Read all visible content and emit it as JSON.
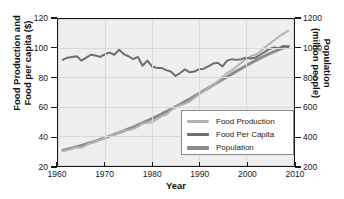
{
  "chart_data": {
    "type": "line",
    "title": "",
    "xlabel": "Year",
    "ylabel": "Food Production and\nFood per capita ($)",
    "ylabel_line1": "Food Production and",
    "ylabel_line2": "Food per capita ($)",
    "y2label_line1": "Population",
    "y2label_line2": "(million people)",
    "xlim": [
      1960,
      2010
    ],
    "ylim": [
      20,
      120
    ],
    "y2lim": [
      200,
      1200
    ],
    "xticks": [
      "1960",
      "1970",
      "1980",
      "1990",
      "2000",
      "2010"
    ],
    "xtick_values": [
      1960,
      1970,
      1980,
      1990,
      2000,
      2010
    ],
    "yticks": [
      "20",
      "40",
      "60",
      "80",
      "100",
      "120"
    ],
    "ytick_values": [
      20,
      40,
      60,
      80,
      100,
      120
    ],
    "y2ticks": [
      "200",
      "400",
      "600",
      "800",
      "1000",
      "1200"
    ],
    "y2tick_values": [
      200,
      400,
      600,
      800,
      1000,
      1200
    ],
    "grid": true,
    "legend_position": "lower right",
    "legend_entries": [
      "Food Production",
      "Food Per Capita",
      "Population"
    ],
    "colors": {
      "food_production": "#b3b3b3",
      "food_per_capita": "#6e6e6e",
      "population": "#8c8c8c",
      "plot_background": "#efefef",
      "axis": "#1a1a1a",
      "gridline": "#d9d9d9"
    },
    "x": [
      1961,
      1962,
      1963,
      1964,
      1965,
      1966,
      1967,
      1968,
      1969,
      1970,
      1971,
      1972,
      1973,
      1974,
      1975,
      1976,
      1977,
      1978,
      1979,
      1980,
      1981,
      1982,
      1983,
      1984,
      1985,
      1986,
      1987,
      1988,
      1989,
      1990,
      1991,
      1992,
      1993,
      1994,
      1995,
      1996,
      1997,
      1998,
      1999,
      2000,
      2001,
      2002,
      2003,
      2004,
      2005,
      2006,
      2007,
      2008,
      2009
    ],
    "series": [
      {
        "name": "Food Production",
        "axis": "left",
        "values": [
          29.5,
          30.3,
          31.3,
          32.2,
          32.0,
          33.6,
          35.1,
          36.3,
          37.2,
          38.6,
          40.0,
          40.5,
          42.5,
          43.3,
          44.0,
          44.6,
          46.3,
          48.5,
          49.0,
          49.3,
          51.2,
          53.3,
          54.5,
          57.3,
          59.5,
          61.0,
          62.0,
          63.5,
          66.0,
          68.5,
          70.5,
          73.0,
          75.0,
          77.0,
          80.5,
          83.0,
          85.0,
          87.5,
          90.0,
          92.5,
          94.5,
          95.5,
          97.5,
          100.5,
          103.0,
          105.5,
          108.0,
          110.0,
          112.0
        ]
      },
      {
        "name": "Food Per Capita",
        "axis": "left",
        "values": [
          92.0,
          93.5,
          94.0,
          94.5,
          91.5,
          93.5,
          95.5,
          95.0,
          94.0,
          96.0,
          97.0,
          95.5,
          99.0,
          96.0,
          94.5,
          92.5,
          94.0,
          88.0,
          91.5,
          87.5,
          86.5,
          86.5,
          85.0,
          84.0,
          81.0,
          83.0,
          85.5,
          83.5,
          84.0,
          85.5,
          86.0,
          87.5,
          89.5,
          90.0,
          87.5,
          91.5,
          92.5,
          92.0,
          92.5,
          93.5,
          93.0,
          93.5,
          95.5,
          97.5,
          99.5,
          100.5,
          100.0,
          101.5,
          101.0
        ]
      },
      {
        "name": "Population",
        "axis": "right",
        "values": [
          30.0,
          30.8,
          31.6,
          32.5,
          33.4,
          34.4,
          35.4,
          36.4,
          37.5,
          38.6,
          39.8,
          41.0,
          42.2,
          43.4,
          44.7,
          46.0,
          47.4,
          48.8,
          50.3,
          51.8,
          53.3,
          54.9,
          56.5,
          58.2,
          59.9,
          61.6,
          63.4,
          65.2,
          67.1,
          69.0,
          70.9,
          72.8,
          74.8,
          76.7,
          78.6,
          80.5,
          82.4,
          84.3,
          86.1,
          88.0,
          89.8,
          91.5,
          93.2,
          94.8,
          96.3,
          97.7,
          99.0,
          100.2,
          101.3
        ],
        "values_right_axis": [
          300,
          308,
          316,
          325,
          334,
          344,
          354,
          364,
          375,
          386,
          398,
          410,
          422,
          434,
          447,
          460,
          474,
          488,
          503,
          518,
          533,
          549,
          565,
          582,
          599,
          616,
          634,
          652,
          671,
          690,
          709,
          728,
          748,
          767,
          786,
          805,
          824,
          843,
          861,
          880,
          898,
          915,
          932,
          948,
          963,
          977,
          990,
          1002,
          1013
        ]
      }
    ]
  }
}
